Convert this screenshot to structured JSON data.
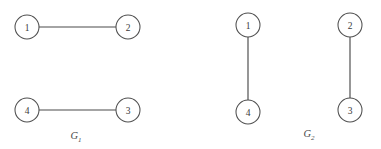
{
  "figure": {
    "width": 381,
    "height": 149,
    "background_color": "#ffffff",
    "stroke_color": "#4a4a4a",
    "node_fill_color": "#ffffff",
    "label_color": "#3a3a3a",
    "node_radius": 12
  },
  "graphs": [
    {
      "id": "G1",
      "caption_base": "G",
      "caption_sub": "1",
      "caption_x": 76,
      "caption_y": 139,
      "nodes": [
        {
          "id": "g1-n1",
          "label": "1",
          "cx": 27,
          "cy": 27
        },
        {
          "id": "g1-n2",
          "label": "2",
          "cx": 128,
          "cy": 27
        },
        {
          "id": "g1-n4",
          "label": "4",
          "cx": 27,
          "cy": 110
        },
        {
          "id": "g1-n3",
          "label": "3",
          "cx": 128,
          "cy": 110
        }
      ],
      "edges": [
        {
          "id": "g1-e12",
          "label": "1-2",
          "x1": 39,
          "y1": 27,
          "x2": 116,
          "y2": 27
        },
        {
          "id": "g1-e43",
          "label": "4-3",
          "x1": 39,
          "y1": 110,
          "x2": 116,
          "y2": 110
        }
      ]
    },
    {
      "id": "G2",
      "caption_base": "G",
      "caption_sub": "2",
      "caption_x": 309,
      "caption_y": 137,
      "nodes": [
        {
          "id": "g2-n1",
          "label": "1",
          "cx": 248,
          "cy": 25
        },
        {
          "id": "g2-n4",
          "label": "4",
          "cx": 248,
          "cy": 112
        },
        {
          "id": "g2-n2",
          "label": "2",
          "cx": 350,
          "cy": 25
        },
        {
          "id": "g2-n3",
          "label": "3",
          "cx": 350,
          "cy": 110
        }
      ],
      "edges": [
        {
          "id": "g2-e14",
          "label": "1-4",
          "x1": 248,
          "y1": 37,
          "x2": 248,
          "y2": 100
        },
        {
          "id": "g2-e23",
          "label": "2-3",
          "x1": 350,
          "y1": 37,
          "x2": 350,
          "y2": 98
        }
      ]
    }
  ]
}
